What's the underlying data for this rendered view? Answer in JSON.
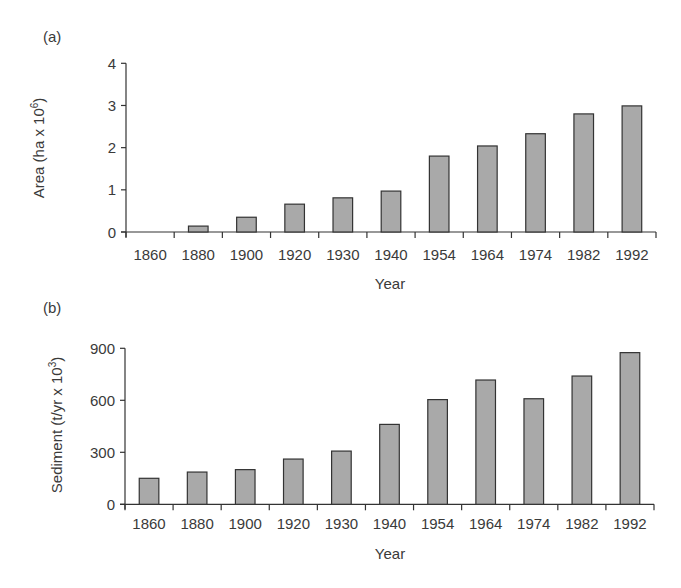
{
  "chart_data": [
    {
      "panel": "(a)",
      "type": "bar",
      "title": "",
      "xlabel": "Year",
      "ylabel": "Area (ha x 10^6)",
      "ylabel_base": "Area (ha x 10",
      "ylabel_exp": "6",
      "ylabel_close": ")",
      "ylim": [
        0,
        4
      ],
      "yticks": [
        0,
        1,
        2,
        3,
        4
      ],
      "categories": [
        "1860",
        "1880",
        "1900",
        "1920",
        "1930",
        "1940",
        "1954",
        "1964",
        "1974",
        "1982",
        "1992"
      ],
      "values": [
        0,
        0.14,
        0.35,
        0.66,
        0.81,
        0.97,
        1.8,
        2.04,
        2.33,
        2.8,
        2.99
      ],
      "grid": false,
      "legend": null
    },
    {
      "panel": "(b)",
      "type": "bar",
      "title": "",
      "xlabel": "Year",
      "ylabel": "Sediment (t/yr x 10^3)",
      "ylabel_base": "Sediment (t/yr x 10",
      "ylabel_exp": "3",
      "ylabel_close": ")",
      "ylim": [
        0,
        900
      ],
      "yticks": [
        0,
        300,
        600,
        900
      ],
      "categories": [
        "1860",
        "1880",
        "1900",
        "1920",
        "1930",
        "1940",
        "1954",
        "1964",
        "1974",
        "1982",
        "1992"
      ],
      "values": [
        150,
        186,
        200,
        261,
        307,
        461,
        604,
        717,
        609,
        740,
        875
      ],
      "grid": false,
      "legend": null
    }
  ],
  "colors": {
    "bar_fill": "#a9a9a9",
    "bar_stroke": "#333333",
    "axis": "#333333",
    "text": "#3a3a3a"
  }
}
